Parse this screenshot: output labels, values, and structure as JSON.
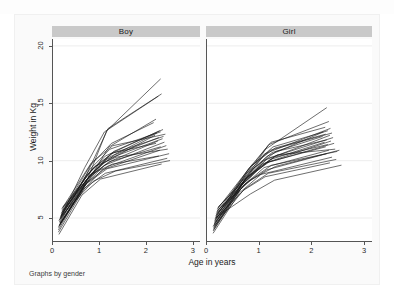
{
  "figure": {
    "note": "Graphs by gender",
    "xlabel": "Age in years",
    "ylabel": "Weight in Kg",
    "panel_boy_title": "Boy",
    "panel_girl_title": "Girl",
    "header_color": "#c9c9c9",
    "line_color": "#141414",
    "grid_color": "#ededed",
    "axis_color": "#555555"
  },
  "axes": {
    "xticks": [
      "0",
      "1",
      "2",
      "3"
    ],
    "yticks": [
      "5",
      "10",
      "15",
      "20"
    ]
  },
  "chart_data": {
    "type": "line",
    "title": "",
    "subtitle": "",
    "xlabel": "Age in years",
    "ylabel": "Weight in Kg",
    "note": "Graphs by gender",
    "xlim": [
      0,
      3.15
    ],
    "ylim": [
      3.0,
      20.6
    ],
    "xticks": [
      0,
      1,
      2,
      3
    ],
    "yticks": [
      5,
      10,
      15,
      20
    ],
    "grid": "horizontal",
    "legend": "none",
    "panels": [
      {
        "name": "Boy",
        "series": [
          {
            "name": "boy-01",
            "x": [
              0.12,
              0.7,
              1.15,
              2.3
            ],
            "y": [
              4.2,
              8.0,
              12.6,
              17.1
            ]
          },
          {
            "name": "boy-02",
            "x": [
              0.15,
              0.72,
              1.18,
              2.32
            ],
            "y": [
              4.6,
              8.8,
              12.8,
              15.8
            ]
          },
          {
            "name": "boy-03",
            "x": [
              0.16,
              0.68,
              1.1,
              2.25
            ],
            "y": [
              5.0,
              9.4,
              12.5,
              15.6
            ]
          },
          {
            "name": "boy-04",
            "x": [
              0.14,
              0.75,
              1.2,
              2.2
            ],
            "y": [
              4.4,
              8.2,
              11.2,
              13.6
            ]
          },
          {
            "name": "boy-05",
            "x": [
              0.18,
              0.8,
              1.25,
              2.15
            ],
            "y": [
              5.4,
              9.6,
              11.5,
              13.3
            ]
          },
          {
            "name": "boy-06",
            "x": [
              0.2,
              0.85,
              1.3,
              2.35
            ],
            "y": [
              5.6,
              9.0,
              10.8,
              12.7
            ]
          },
          {
            "name": "boy-07",
            "x": [
              0.13,
              0.7,
              1.12,
              2.28
            ],
            "y": [
              4.8,
              8.6,
              10.4,
              12.6
            ]
          },
          {
            "name": "boy-08",
            "x": [
              0.17,
              0.78,
              1.22,
              2.3
            ],
            "y": [
              5.2,
              9.2,
              11.0,
              12.5
            ]
          },
          {
            "name": "boy-09",
            "x": [
              0.15,
              0.74,
              1.16,
              2.22
            ],
            "y": [
              4.5,
              8.4,
              10.2,
              12.4
            ]
          },
          {
            "name": "boy-10",
            "x": [
              0.19,
              0.82,
              1.28,
              2.4
            ],
            "y": [
              5.8,
              9.8,
              11.3,
              12.3
            ]
          },
          {
            "name": "boy-11",
            "x": [
              0.12,
              0.66,
              1.08,
              2.18
            ],
            "y": [
              4.0,
              7.8,
              9.8,
              12.2
            ]
          },
          {
            "name": "boy-12",
            "x": [
              0.16,
              0.76,
              1.24,
              2.36
            ],
            "y": [
              5.1,
              8.9,
              10.6,
              12.1
            ]
          },
          {
            "name": "boy-13",
            "x": [
              0.21,
              0.88,
              1.32,
              2.26
            ],
            "y": [
              5.9,
              9.1,
              10.5,
              12.0
            ]
          },
          {
            "name": "boy-14",
            "x": [
              0.14,
              0.71,
              1.14,
              2.34
            ],
            "y": [
              4.7,
              8.3,
              10.1,
              11.9
            ]
          },
          {
            "name": "boy-15",
            "x": [
              0.18,
              0.79,
              1.26,
              2.24
            ],
            "y": [
              5.3,
              8.7,
              10.0,
              11.7
            ]
          },
          {
            "name": "boy-16",
            "x": [
              0.13,
              0.69,
              1.1,
              2.38
            ],
            "y": [
              4.3,
              7.9,
              9.6,
              11.6
            ]
          },
          {
            "name": "boy-17",
            "x": [
              0.2,
              0.84,
              1.3,
              2.2
            ],
            "y": [
              5.7,
              9.3,
              10.7,
              11.5
            ]
          },
          {
            "name": "boy-18",
            "x": [
              0.15,
              0.73,
              1.18,
              2.42
            ],
            "y": [
              4.9,
              8.1,
              9.5,
              11.3
            ]
          },
          {
            "name": "boy-19",
            "x": [
              0.17,
              0.77,
              1.2,
              2.3
            ],
            "y": [
              5.0,
              8.5,
              9.9,
              11.2
            ]
          },
          {
            "name": "boy-20",
            "x": [
              0.22,
              0.9,
              1.35,
              2.45
            ],
            "y": [
              6.0,
              9.5,
              10.3,
              11.0
            ]
          },
          {
            "name": "boy-21",
            "x": [
              0.12,
              0.64,
              1.05,
              2.28
            ],
            "y": [
              3.8,
              7.4,
              9.2,
              10.9
            ]
          },
          {
            "name": "boy-22",
            "x": [
              0.16,
              0.72,
              1.16,
              2.48
            ],
            "y": [
              4.6,
              8.0,
              9.3,
              10.6
            ]
          },
          {
            "name": "boy-23",
            "x": [
              0.19,
              0.81,
              1.27,
              2.26
            ],
            "y": [
              5.5,
              8.8,
              9.7,
              10.4
            ]
          },
          {
            "name": "boy-24",
            "x": [
              0.14,
              0.68,
              1.12,
              2.44
            ],
            "y": [
              4.4,
              7.6,
              8.9,
              10.2
            ]
          },
          {
            "name": "boy-25",
            "x": [
              0.18,
              0.86,
              1.34,
              2.5
            ],
            "y": [
              5.2,
              8.2,
              9.1,
              10.0
            ]
          },
          {
            "name": "boy-26",
            "x": [
              0.13,
              0.62,
              1.02,
              2.32
            ],
            "y": [
              3.6,
              7.0,
              8.4,
              9.7
            ]
          }
        ]
      },
      {
        "name": "Girl",
        "series": [
          {
            "name": "girl-01",
            "x": [
              0.13,
              0.7,
              1.12,
              2.28
            ],
            "y": [
              4.1,
              8.2,
              11.0,
              14.6
            ]
          },
          {
            "name": "girl-02",
            "x": [
              0.15,
              0.74,
              1.18,
              2.32
            ],
            "y": [
              4.7,
              8.8,
              11.4,
              13.4
            ]
          },
          {
            "name": "girl-03",
            "x": [
              0.17,
              0.78,
              1.22,
              2.25
            ],
            "y": [
              5.1,
              9.2,
              11.6,
              12.9
            ]
          },
          {
            "name": "girl-04",
            "x": [
              0.12,
              0.68,
              1.1,
              2.35
            ],
            "y": [
              4.3,
              8.0,
              10.6,
              12.8
            ]
          },
          {
            "name": "girl-05",
            "x": [
              0.19,
              0.82,
              1.26,
              2.3
            ],
            "y": [
              5.5,
              9.4,
              11.2,
              12.6
            ]
          },
          {
            "name": "girl-06",
            "x": [
              0.14,
              0.72,
              1.15,
              2.22
            ],
            "y": [
              4.5,
              8.4,
              10.4,
              12.5
            ]
          },
          {
            "name": "girl-07",
            "x": [
              0.16,
              0.76,
              1.2,
              2.38
            ],
            "y": [
              5.0,
              8.9,
              10.9,
              12.4
            ]
          },
          {
            "name": "girl-08",
            "x": [
              0.2,
              0.85,
              1.3,
              2.26
            ],
            "y": [
              5.8,
              9.6,
              11.1,
              12.3
            ]
          },
          {
            "name": "girl-09",
            "x": [
              0.13,
              0.66,
              1.08,
              2.34
            ],
            "y": [
              4.0,
              7.8,
              10.0,
              12.2
            ]
          },
          {
            "name": "girl-10",
            "x": [
              0.18,
              0.8,
              1.24,
              2.2
            ],
            "y": [
              5.3,
              9.0,
              10.7,
              12.1
            ]
          },
          {
            "name": "girl-11",
            "x": [
              0.15,
              0.73,
              1.16,
              2.4
            ],
            "y": [
              4.8,
              8.3,
              10.2,
              12.0
            ]
          },
          {
            "name": "girl-12",
            "x": [
              0.21,
              0.88,
              1.32,
              2.28
            ],
            "y": [
              5.9,
              9.3,
              10.8,
              11.8
            ]
          },
          {
            "name": "girl-13",
            "x": [
              0.12,
              0.64,
              1.05,
              2.36
            ],
            "y": [
              3.9,
              7.5,
              9.7,
              11.7
            ]
          },
          {
            "name": "girl-14",
            "x": [
              0.17,
              0.77,
              1.21,
              2.24
            ],
            "y": [
              5.2,
              8.6,
              10.1,
              11.6
            ]
          },
          {
            "name": "girl-15",
            "x": [
              0.14,
              0.7,
              1.13,
              2.42
            ],
            "y": [
              4.4,
              8.1,
              9.8,
              11.5
            ]
          },
          {
            "name": "girl-16",
            "x": [
              0.19,
              0.84,
              1.28,
              2.3
            ],
            "y": [
              5.6,
              8.7,
              10.3,
              11.4
            ]
          },
          {
            "name": "girl-17",
            "x": [
              0.16,
              0.75,
              1.19,
              2.26
            ],
            "y": [
              4.9,
              8.5,
              9.9,
              11.2
            ]
          },
          {
            "name": "girl-18",
            "x": [
              0.22,
              0.9,
              1.34,
              2.44
            ],
            "y": [
              6.0,
              9.1,
              10.5,
              11.0
            ]
          },
          {
            "name": "girl-19",
            "x": [
              0.13,
              0.67,
              1.09,
              2.32
            ],
            "y": [
              4.2,
              7.7,
              9.4,
              10.9
            ]
          },
          {
            "name": "girl-20",
            "x": [
              0.18,
              0.79,
              1.23,
              2.48
            ],
            "y": [
              5.4,
              8.2,
              9.6,
              10.8
            ]
          },
          {
            "name": "girl-21",
            "x": [
              0.15,
              0.71,
              1.14,
              2.28
            ],
            "y": [
              4.6,
              7.9,
              9.2,
              10.6
            ]
          },
          {
            "name": "girl-22",
            "x": [
              0.2,
              0.86,
              1.31,
              2.52
            ],
            "y": [
              5.7,
              8.4,
              9.5,
              10.9
            ]
          },
          {
            "name": "girl-23",
            "x": [
              0.12,
              0.62,
              1.03,
              2.38
            ],
            "y": [
              3.7,
              7.2,
              8.8,
              10.3
            ]
          },
          {
            "name": "girl-24",
            "x": [
              0.17,
              0.74,
              1.17,
              2.46
            ],
            "y": [
              5.0,
              7.6,
              8.9,
              10.1
            ]
          },
          {
            "name": "girl-25",
            "x": [
              0.14,
              0.69,
              1.11,
              2.34
            ],
            "y": [
              4.3,
              7.4,
              8.6,
              9.8
            ]
          },
          {
            "name": "girl-26",
            "x": [
              0.19,
              0.83,
              1.29,
              2.56
            ],
            "y": [
              5.1,
              7.1,
              8.3,
              9.6
            ]
          }
        ]
      }
    ]
  }
}
